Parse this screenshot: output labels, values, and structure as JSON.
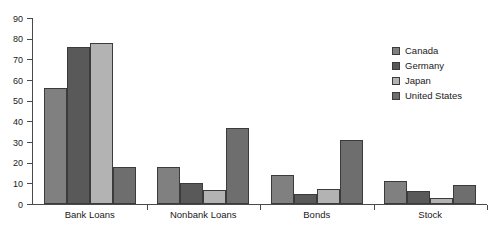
{
  "chart_data": {
    "type": "bar",
    "title": "",
    "xlabel": "",
    "ylabel": "",
    "ylim": [
      0,
      90
    ],
    "ytick_step": 10,
    "yticks": [
      90,
      80,
      70,
      60,
      50,
      40,
      30,
      20,
      10,
      0
    ],
    "grid": false,
    "legend_position": "right",
    "categories": [
      "Bank Loans",
      "Nonbank Loans",
      "Bonds",
      "Stock"
    ],
    "series": [
      {
        "name": "Canada",
        "color": "#808080",
        "values": [
          56,
          18,
          14,
          11
        ]
      },
      {
        "name": "Germany",
        "color": "#595959",
        "values": [
          76,
          10,
          5,
          6.5
        ]
      },
      {
        "name": "Japan",
        "color": "#b3b3b3",
        "values": [
          78,
          7,
          7.5,
          3
        ]
      },
      {
        "name": "United States",
        "color": "#6e6e6e",
        "values": [
          18,
          37,
          31,
          9
        ]
      }
    ]
  },
  "axis": {
    "line_color": "#4a4a4a",
    "bar_outline_color": "#3b3b3b"
  }
}
